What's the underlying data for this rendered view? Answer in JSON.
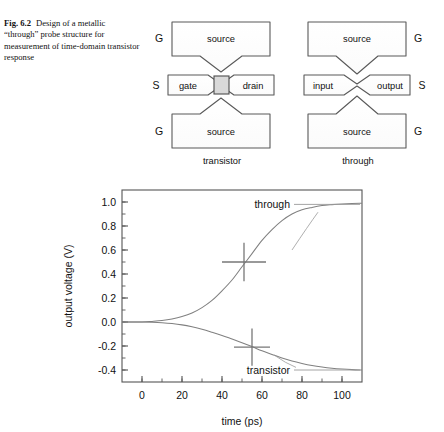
{
  "caption": {
    "number": "Fig. 6.2",
    "text": "Design of a metallic “through” probe structure for measurement of time-domain transistor response"
  },
  "figure": {
    "transistor_diagram": {
      "caption": "transistor",
      "pads": [
        {
          "id": "top-source",
          "label": "source"
        },
        {
          "id": "gate",
          "label": "gate"
        },
        {
          "id": "drain",
          "label": "drain"
        },
        {
          "id": "bottom-source",
          "label": "source"
        }
      ],
      "probe_tips": [
        {
          "id": "tip-top-left",
          "label": "G"
        },
        {
          "id": "tip-mid-left",
          "label": "S"
        },
        {
          "id": "tip-bottom-left",
          "label": "G"
        }
      ],
      "device_note": "active transistor channel"
    },
    "through_diagram": {
      "caption": "through",
      "pads": [
        {
          "id": "top-source",
          "label": "source"
        },
        {
          "id": "input",
          "label": "input"
        },
        {
          "id": "output",
          "label": "output"
        },
        {
          "id": "bottom-source",
          "label": "source"
        }
      ],
      "probe_tips": [
        {
          "id": "tip-top-right",
          "label": "G"
        },
        {
          "id": "tip-mid-right",
          "label": "S"
        },
        {
          "id": "tip-bottom-right",
          "label": "G"
        }
      ]
    }
  },
  "chart_data": {
    "type": "line",
    "title": "",
    "xlabel": "time (ps)",
    "ylabel": "output voltage (V)",
    "xlim": [
      -10,
      110
    ],
    "ylim": [
      -0.5,
      1.1
    ],
    "xticks": [
      0,
      20,
      40,
      60,
      80,
      100
    ],
    "xtick_labels": [
      "0",
      "20",
      "40",
      "60",
      "80",
      "100"
    ],
    "yticks": [
      -0.4,
      -0.2,
      0.0,
      0.2,
      0.4,
      0.6,
      0.8,
      1.0
    ],
    "ytick_labels": [
      "-0.4",
      "-0.2",
      "0.0",
      "0.2",
      "0.4",
      "0.6",
      "0.8",
      "1.0"
    ],
    "xminor_step": 10,
    "yminor_step": 0.1,
    "grid": false,
    "legend": "inline-annotations",
    "series": [
      {
        "name": "through",
        "label": "through",
        "color": "#808080",
        "x": [
          -10,
          0,
          5,
          10,
          15,
          20,
          25,
          30,
          35,
          40,
          45,
          50,
          55,
          60,
          65,
          70,
          75,
          80,
          85,
          90,
          95,
          100,
          105,
          110
        ],
        "values": [
          0.0,
          0.0,
          0.005,
          0.012,
          0.025,
          0.045,
          0.075,
          0.12,
          0.18,
          0.26,
          0.35,
          0.46,
          0.57,
          0.68,
          0.77,
          0.845,
          0.9,
          0.935,
          0.955,
          0.97,
          0.978,
          0.984,
          0.988,
          0.99
        ]
      },
      {
        "name": "transistor",
        "label": "transistor",
        "color": "#808080",
        "x": [
          -10,
          0,
          5,
          10,
          15,
          20,
          25,
          30,
          35,
          40,
          45,
          50,
          55,
          60,
          65,
          70,
          75,
          80,
          85,
          90,
          95,
          100,
          105,
          110
        ],
        "values": [
          0.0,
          0.0,
          -0.002,
          -0.006,
          -0.013,
          -0.024,
          -0.04,
          -0.06,
          -0.085,
          -0.112,
          -0.142,
          -0.172,
          -0.205,
          -0.24,
          -0.27,
          -0.3,
          -0.325,
          -0.345,
          -0.362,
          -0.375,
          -0.385,
          -0.392,
          -0.397,
          -0.4
        ]
      }
    ],
    "error_markers": [
      {
        "series": "through",
        "x": 51,
        "y": 0.5,
        "xerr": 11,
        "yerr": 0.16,
        "color": "#777777"
      },
      {
        "series": "transistor",
        "x": 55,
        "y": -0.21,
        "xerr": 9,
        "yerr": 0.155,
        "color": "#777777"
      }
    ],
    "annotations": [
      {
        "text": "through",
        "x": 100,
        "y": 0.98,
        "leader": true
      },
      {
        "text": "transistor",
        "x": 100,
        "y": -0.4,
        "leader": true
      }
    ]
  }
}
